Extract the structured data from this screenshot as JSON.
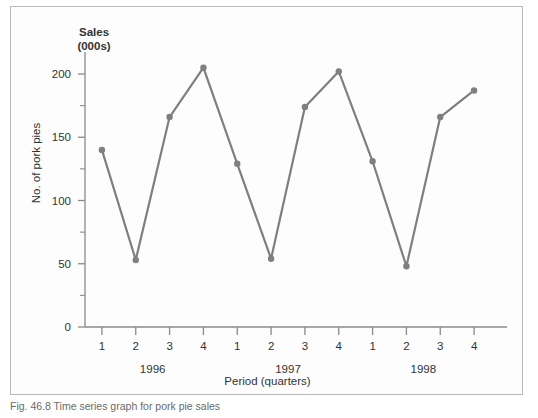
{
  "figure": {
    "caption": "Fig. 46.8 Time series graph for pork pie sales"
  },
  "chart_data": {
    "type": "line",
    "title": "",
    "y_axis_top_label": "Sales\n(000s)",
    "y_axis_top_label_line1": "Sales",
    "y_axis_top_label_line2": "(000s)",
    "ylabel": "No. of pork pies",
    "xlabel": "Period (quarters)",
    "ylim": [
      0,
      212
    ],
    "yticks": [
      0,
      50,
      100,
      150,
      200
    ],
    "ytick_labels": [
      "0",
      "50",
      "100",
      "150",
      "200"
    ],
    "yminor_ticks": [
      25,
      75,
      125,
      175
    ],
    "grid": false,
    "legend": false,
    "line_color": "#7f7f7f",
    "marker_color": "#7f7f7f",
    "axis_color": "#8a8a8a",
    "categories": [
      "1",
      "2",
      "3",
      "4",
      "1",
      "2",
      "3",
      "4",
      "1",
      "2",
      "3",
      "4"
    ],
    "values": [
      140,
      53,
      166,
      205,
      129,
      54,
      174,
      202,
      131,
      48,
      166,
      187
    ],
    "groups": [
      {
        "label": "1996",
        "start_index": 0,
        "end_index": 3
      },
      {
        "label": "1997",
        "start_index": 4,
        "end_index": 7
      },
      {
        "label": "1998",
        "start_index": 8,
        "end_index": 11
      }
    ],
    "points": [
      {
        "year": "1996",
        "quarter": "1",
        "value": 140
      },
      {
        "year": "1996",
        "quarter": "2",
        "value": 53
      },
      {
        "year": "1996",
        "quarter": "3",
        "value": 166
      },
      {
        "year": "1996",
        "quarter": "4",
        "value": 205
      },
      {
        "year": "1997",
        "quarter": "1",
        "value": 129
      },
      {
        "year": "1997",
        "quarter": "2",
        "value": 54
      },
      {
        "year": "1997",
        "quarter": "3",
        "value": 174
      },
      {
        "year": "1997",
        "quarter": "4",
        "value": 202
      },
      {
        "year": "1998",
        "quarter": "1",
        "value": 131
      },
      {
        "year": "1998",
        "quarter": "2",
        "value": 48
      },
      {
        "year": "1998",
        "quarter": "3",
        "value": 166
      },
      {
        "year": "1998",
        "quarter": "4",
        "value": 187
      }
    ]
  }
}
